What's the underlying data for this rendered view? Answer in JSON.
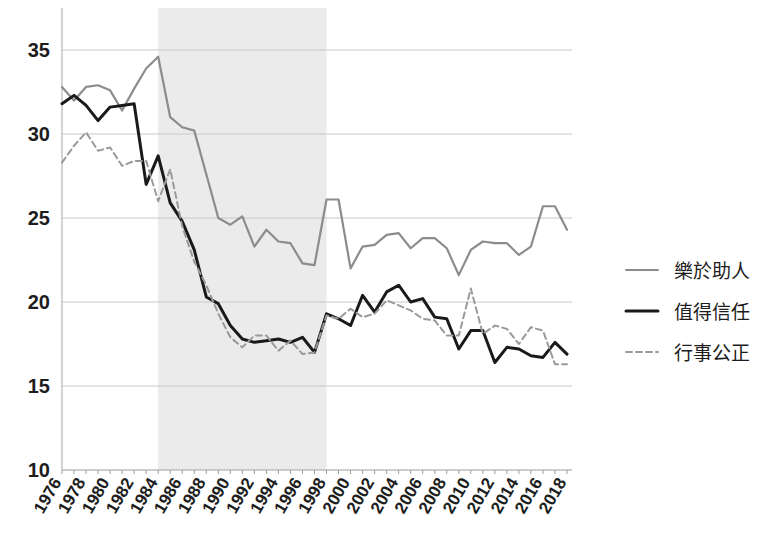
{
  "chart_data": {
    "type": "line",
    "title": "",
    "xlabel": "",
    "ylabel": "",
    "xlim": [
      1976,
      2018
    ],
    "ylim": [
      10,
      35
    ],
    "yticks": [
      10,
      15,
      20,
      25,
      30,
      35
    ],
    "grid": "horizontal",
    "legend_position": "right",
    "shaded_region": {
      "label": "",
      "x_start": 1984,
      "x_end": 1998,
      "color": "#ebebeb"
    },
    "x": [
      1976,
      1977,
      1978,
      1979,
      1980,
      1981,
      1982,
      1983,
      1984,
      1985,
      1986,
      1987,
      1988,
      1989,
      1990,
      1991,
      1992,
      1993,
      1994,
      1995,
      1996,
      1997,
      1998,
      1999,
      2000,
      2001,
      2002,
      2003,
      2004,
      2005,
      2006,
      2007,
      2008,
      2009,
      2010,
      2011,
      2012,
      2013,
      2014,
      2015,
      2016,
      2017,
      2018
    ],
    "series": [
      {
        "name": "樂於助人",
        "color": "#8c8c8c",
        "style": "solid",
        "width": 2.2,
        "values": [
          32.8,
          32.0,
          32.8,
          32.9,
          32.6,
          31.4,
          32.7,
          33.9,
          34.6,
          31.0,
          30.4,
          30.2,
          27.6,
          25.0,
          24.6,
          25.1,
          23.3,
          24.3,
          23.6,
          23.5,
          22.3,
          22.2,
          26.1,
          26.1,
          22.0,
          23.3,
          23.4,
          24.0,
          24.1,
          23.2,
          23.8,
          23.8,
          23.2,
          21.6,
          23.1,
          23.6,
          23.5,
          23.5,
          22.8,
          23.3,
          25.7,
          25.7,
          24.3
        ]
      },
      {
        "name": "值得信任",
        "color": "#1a1a1a",
        "style": "solid",
        "width": 3.0,
        "values": [
          31.8,
          32.3,
          31.7,
          30.8,
          31.6,
          31.7,
          31.8,
          27.0,
          28.7,
          25.9,
          24.8,
          23.1,
          20.3,
          19.9,
          18.6,
          17.8,
          17.6,
          17.7,
          17.8,
          17.6,
          17.9,
          17.0,
          19.3,
          19.0,
          18.6,
          20.4,
          19.4,
          20.6,
          21.0,
          20.0,
          20.2,
          19.1,
          19.0,
          17.2,
          18.3,
          18.3,
          16.4,
          17.3,
          17.2,
          16.8,
          16.7,
          17.6,
          16.9
        ]
      },
      {
        "name": "行事公正",
        "color": "#9a9a9a",
        "style": "dashed",
        "width": 2.0,
        "values": [
          28.3,
          29.3,
          30.1,
          29.0,
          29.2,
          28.1,
          28.4,
          28.4,
          26.0,
          27.9,
          24.5,
          22.4,
          21.0,
          19.3,
          17.9,
          17.3,
          18.0,
          18.0,
          17.1,
          17.7,
          16.9,
          17.0,
          19.2,
          19.0,
          19.6,
          19.1,
          19.3,
          20.1,
          19.8,
          19.5,
          19.0,
          18.9,
          18.0,
          18.0,
          20.8,
          18.1,
          18.6,
          18.4,
          17.5,
          18.5,
          18.3,
          16.3,
          16.3
        ]
      }
    ],
    "xtick_labels": [
      "1976",
      "1978",
      "1980",
      "1982",
      "1984",
      "1986",
      "1988",
      "1990",
      "1992",
      "1994",
      "1996",
      "1998",
      "2000",
      "2002",
      "2004",
      "2006",
      "2008",
      "2010",
      "2012",
      "2014",
      "2016",
      "2018"
    ],
    "ytick_labels": [
      "10",
      "15",
      "20",
      "25",
      "30",
      "35"
    ]
  }
}
